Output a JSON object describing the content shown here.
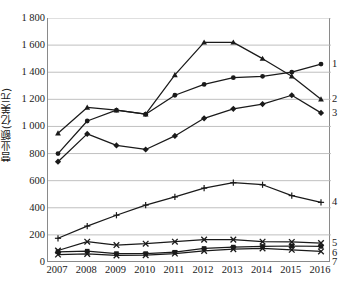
{
  "chart_data": {
    "type": "line",
    "title": "",
    "xlabel": "",
    "ylabel": "营业额(亿美元)",
    "categories": [
      "2007",
      "2008",
      "2009",
      "2010",
      "2011",
      "2012",
      "2013",
      "2014",
      "2015",
      "2016"
    ],
    "x": [
      2007,
      2008,
      2009,
      2010,
      2011,
      2012,
      2013,
      2014,
      2015,
      2016
    ],
    "ylim": [
      0,
      1800
    ],
    "yticks": [
      0,
      200,
      400,
      600,
      800,
      1000,
      1200,
      1400,
      1600,
      1800
    ],
    "ytick_labels": [
      "0",
      "200",
      "400",
      "600",
      "800",
      "1 000",
      "1 200",
      "1 400",
      "1 600",
      "1 800"
    ],
    "grid": true,
    "legend_position": "right-end-labels",
    "series": [
      {
        "name": "1",
        "label": "1",
        "marker": "circle",
        "values": [
          800,
          1040,
          1120,
          1090,
          1230,
          1310,
          1360,
          1370,
          1400,
          1460
        ]
      },
      {
        "name": "2",
        "label": "2",
        "marker": "triangle",
        "values": [
          950,
          1140,
          1120,
          1090,
          1380,
          1620,
          1620,
          1500,
          1370,
          1200
        ]
      },
      {
        "name": "3",
        "label": "3",
        "marker": "diamond",
        "values": [
          740,
          945,
          860,
          830,
          930,
          1060,
          1130,
          1165,
          1230,
          1100
        ]
      },
      {
        "name": "4",
        "label": "4",
        "marker": "plus",
        "values": [
          175,
          265,
          345,
          420,
          480,
          545,
          585,
          570,
          490,
          440
        ]
      },
      {
        "name": "5",
        "label": "5",
        "marker": "cross",
        "values": [
          85,
          150,
          125,
          135,
          150,
          165,
          165,
          150,
          148,
          140
        ]
      },
      {
        "name": "6",
        "label": "6",
        "marker": "square",
        "values": [
          75,
          80,
          62,
          62,
          72,
          100,
          110,
          115,
          118,
          115
        ]
      },
      {
        "name": "7",
        "label": "7",
        "marker": "cross",
        "values": [
          55,
          60,
          48,
          50,
          62,
          82,
          95,
          100,
          90,
          78
        ]
      }
    ]
  },
  "axis": {
    "y_title": "营业额(亿美元)",
    "y_tick_labels": [
      "1 800",
      "1 600",
      "1 400",
      "1 200",
      "1 000",
      "800",
      "600",
      "400",
      "200",
      "0"
    ],
    "x_tick_labels": [
      "2007",
      "2008",
      "2009",
      "2010",
      "2011",
      "2012",
      "2013",
      "2014",
      "2015",
      "2016"
    ]
  },
  "series_labels": [
    "1",
    "2",
    "3",
    "4",
    "5",
    "6",
    "7"
  ],
  "colors": {
    "line": "#1a1a1a",
    "grid": "#b9b9b9",
    "axis": "#8a8a8a",
    "text": "#1a1a1a",
    "background": "#ffffff"
  }
}
